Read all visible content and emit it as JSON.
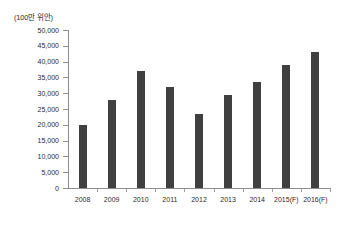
{
  "chart_data": {
    "type": "bar",
    "title": "",
    "unit_label": "(100만 위안)",
    "xlabel": "",
    "ylabel": "",
    "ylim": [
      0,
      50000
    ],
    "ytick_step": 5000,
    "grid": false,
    "legend": "none",
    "bar_color": "#404040",
    "axis_color": "#8d8d8d",
    "categories": [
      "2008",
      "2009",
      "2010",
      "2011",
      "2012",
      "2013",
      "2014",
      "2015(F)",
      "2016(F)"
    ],
    "values": [
      20000,
      28000,
      37000,
      32000,
      23500,
      29500,
      33500,
      39000,
      43000
    ],
    "ytick_labels": [
      "50,000",
      "45,000",
      "40,000",
      "35,000",
      "30,000",
      "25,000",
      "20,000",
      "15,000",
      "10,000",
      "5,000",
      "0"
    ],
    "ytick_values": [
      50000,
      45000,
      40000,
      35000,
      30000,
      25000,
      20000,
      15000,
      10000,
      5000,
      0
    ]
  }
}
